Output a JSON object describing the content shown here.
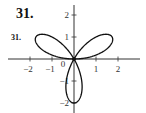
{
  "header": {
    "problem_number": "31."
  },
  "chart_data": {
    "type": "line",
    "title": "",
    "subtitle": "",
    "xlabel": "",
    "ylabel": "",
    "curve_label": "31.",
    "equation_hint": "polar rose r = 2 sin(3θ)",
    "xlim": [
      -3,
      3
    ],
    "ylim": [
      -2.5,
      2.5
    ],
    "grid": false,
    "legend": null,
    "x_ticks": [
      -2,
      -1,
      1,
      2
    ],
    "x_tick_labels": [
      "−2",
      "−1",
      "1",
      "2"
    ],
    "y_ticks": [
      2,
      1,
      -1,
      -2
    ],
    "y_tick_labels": [
      "2",
      "1",
      "−1",
      "−2"
    ],
    "origin_label": "0",
    "series": [
      {
        "name": "three-petal rose",
        "petal_tips": [
          {
            "x": 1.73,
            "y": 1.0
          },
          {
            "x": -1.73,
            "y": 1.0
          },
          {
            "x": 0.0,
            "y": -2.0
          }
        ],
        "max_radius": 2
      }
    ],
    "colors": {
      "curve": "#111111",
      "axes": "#333333"
    }
  }
}
